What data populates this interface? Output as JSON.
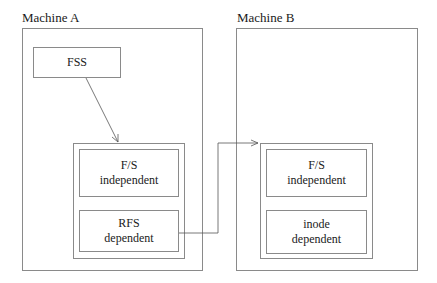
{
  "machines": [
    {
      "label": "Machine A",
      "nodes": {
        "fss": {
          "lines": [
            "FSS"
          ]
        },
        "fs_independent": {
          "lines": [
            "F/S",
            "independent"
          ]
        },
        "rfs_dependent": {
          "lines": [
            "RFS",
            "dependent"
          ]
        }
      }
    },
    {
      "label": "Machine B",
      "nodes": {
        "fs_independent": {
          "lines": [
            "F/S",
            "independent"
          ]
        },
        "inode_dependent": {
          "lines": [
            "inode",
            "dependent"
          ]
        }
      }
    }
  ],
  "edges": [
    {
      "from": "Machine A / FSS",
      "to": "Machine A / F/S independent layer group",
      "style": "arrow"
    },
    {
      "from": "Machine A / RFS dependent",
      "to": "Machine B / F/S independent layer group",
      "style": "arrow"
    }
  ]
}
